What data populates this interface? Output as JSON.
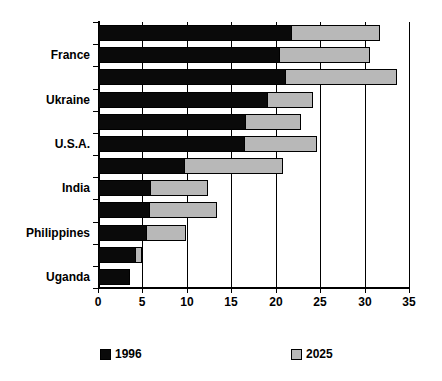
{
  "chart_data": {
    "type": "bar",
    "orientation": "horizontal",
    "title": "",
    "subtitle": "",
    "xlabel": "",
    "ylabel": "",
    "xlim": [
      0,
      35
    ],
    "xticks": [
      0,
      5,
      10,
      15,
      20,
      25,
      30,
      35
    ],
    "xtick_labels": [
      "0",
      "5",
      "10",
      "15",
      "20",
      "25",
      "30",
      "35"
    ],
    "grid": true,
    "grid_axis": "x",
    "legend_position": "bottom",
    "stacked": true,
    "categories": [
      "",
      "France",
      "",
      "Ukraine",
      "",
      "U.S.A.",
      "",
      "India",
      "",
      "Philippines",
      "",
      "Uganda"
    ],
    "visible_category_labels": [
      "France",
      "Ukraine",
      "U.S.A.",
      "India",
      "Philippines",
      "Uganda"
    ],
    "series": [
      {
        "name": "1996",
        "color": "#0a0a0a",
        "values": [
          21.8,
          20.5,
          21.2,
          19.1,
          16.7,
          16.5,
          9.8,
          6.0,
          5.9,
          5.5,
          4.3,
          3.6
        ]
      },
      {
        "name": "2025",
        "color": "#b8b8b8",
        "values": [
          31.7,
          30.6,
          33.7,
          24.2,
          22.9,
          24.7,
          20.8,
          12.4,
          13.4,
          9.9,
          5.0,
          3.6
        ]
      }
    ],
    "legend": [
      {
        "label": "1996",
        "color": "#0a0a0a"
      },
      {
        "label": "2025",
        "color": "#b8b8b8"
      }
    ]
  }
}
